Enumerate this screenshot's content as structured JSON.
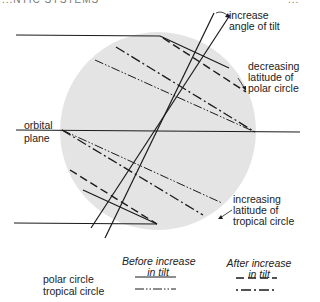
{
  "header": {
    "left_text": "...NTIC SYSTEMS",
    "right_text": "..."
  },
  "diagram": {
    "circle_fill": "#e4e4e4",
    "line_color": "#1a1a1a",
    "labels": {
      "increase_tilt": [
        "increase",
        "angle of tilt"
      ],
      "decreasing_polar": [
        "decreasing",
        "latitude of",
        "polar circle"
      ],
      "orbital_plane": [
        "orbital",
        "plane"
      ],
      "increasing_tropical": [
        "increasing",
        "latitude of",
        "tropical circle"
      ]
    }
  },
  "legend": {
    "col_before": [
      "Before increase",
      "in tilt"
    ],
    "col_after": [
      "After increase",
      "in tilt"
    ],
    "rows": [
      {
        "label": "polar circle",
        "before_style": "solid",
        "after_style": "dashed"
      },
      {
        "label": "tropical circle",
        "before_style": "dash-dot-dot",
        "after_style": "dot-dash-dot"
      }
    ]
  }
}
